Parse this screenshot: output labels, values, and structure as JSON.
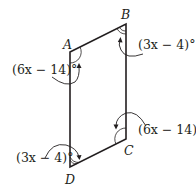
{
  "figure": {
    "type": "parallelogram",
    "vertices": [
      {
        "name": "A",
        "x": 70,
        "y": 52
      },
      {
        "name": "B",
        "x": 126,
        "y": 24
      },
      {
        "name": "C",
        "x": 126,
        "y": 139
      },
      {
        "name": "D",
        "x": 70,
        "y": 167
      }
    ],
    "angle_labels": {
      "A": "(6x − 14)°",
      "B": "(3x − 4)°",
      "C": "(6x − 14)°",
      "D": "(3x − 4)°"
    },
    "vertex_labels": {
      "A": "A",
      "B": "B",
      "C": "C",
      "D": "D"
    },
    "line_color": "#231f20"
  }
}
